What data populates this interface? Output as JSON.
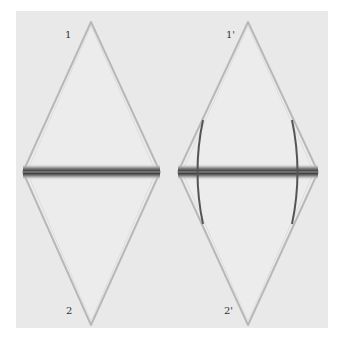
{
  "figure": {
    "background": "#ffffff",
    "panel_color": "#e9e9e9",
    "labels": {
      "left_top": "1",
      "left_bottom": "2",
      "right_top": "1'",
      "right_bottom": "2'"
    },
    "shapes": [
      {
        "name": "left-diamond",
        "top": [
          91,
          22
        ],
        "bottom": [
          91,
          325
        ],
        "left": [
          23,
          172
        ],
        "right": [
          160,
          172
        ]
      },
      {
        "name": "right-diamond",
        "top": [
          248,
          22
        ],
        "bottom": [
          248,
          325
        ],
        "left": [
          178,
          172
        ],
        "right": [
          318,
          172
        ]
      }
    ],
    "band_y": 172,
    "band_color": "#3a3a3a"
  }
}
